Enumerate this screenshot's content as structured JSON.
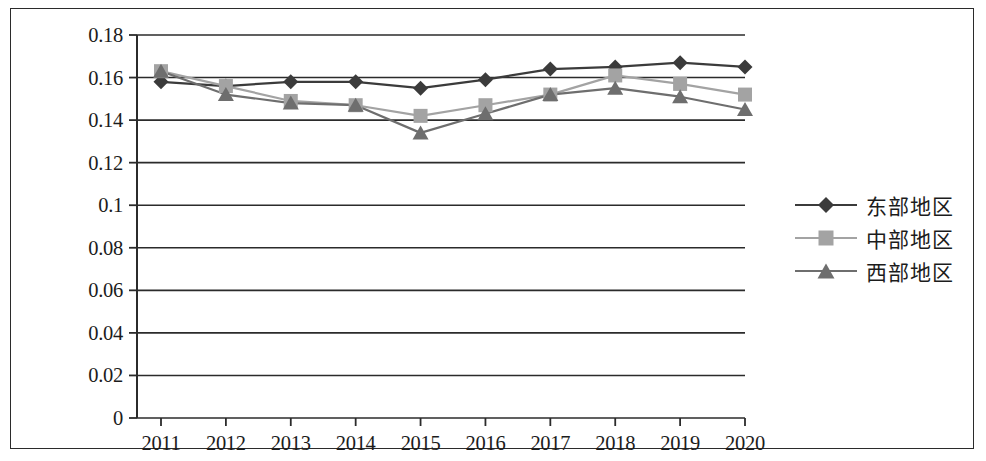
{
  "chart_data": {
    "type": "line",
    "title": "",
    "subtitle": "",
    "xlabel": "",
    "ylabel": "",
    "categories": [
      "2011",
      "2012",
      "2013",
      "2014",
      "2015",
      "2016",
      "2017",
      "2018",
      "2019",
      "2020"
    ],
    "ylim": [
      0,
      0.18
    ],
    "xlim_index": [
      0,
      9
    ],
    "grid": "horizontal",
    "legend_position": "right",
    "y_ticks": [
      "0",
      "0.02",
      "0.04",
      "0.06",
      "0.08",
      "0.1",
      "0.12",
      "0.14",
      "0.16",
      "0.18"
    ],
    "y_tick_values": [
      0,
      0.02,
      0.04,
      0.06,
      0.08,
      0.1,
      0.12,
      0.14,
      0.16,
      0.18
    ],
    "series": [
      {
        "name": "东部地区",
        "marker": "diamond",
        "color": "#3b3b3b",
        "values": [
          0.158,
          0.156,
          0.158,
          0.158,
          0.155,
          0.159,
          0.164,
          0.165,
          0.167,
          0.165
        ]
      },
      {
        "name": "中部地区",
        "marker": "square",
        "color": "#a3a3a3",
        "values": [
          0.163,
          0.156,
          0.149,
          0.147,
          0.142,
          0.147,
          0.152,
          0.161,
          0.157,
          0.152
        ]
      },
      {
        "name": "西部地区",
        "marker": "triangle",
        "color": "#6e6e6e",
        "values": [
          0.163,
          0.152,
          0.148,
          0.147,
          0.134,
          0.143,
          0.152,
          0.155,
          0.151,
          0.145
        ]
      }
    ]
  },
  "legend": {
    "items": [
      {
        "label": "东部地区"
      },
      {
        "label": "中部地区"
      },
      {
        "label": "西部地区"
      }
    ]
  },
  "axis_colors": {
    "axis": "#2b2b2b",
    "gridline": "#2b2b2b",
    "frame": "#2b2b2b"
  }
}
